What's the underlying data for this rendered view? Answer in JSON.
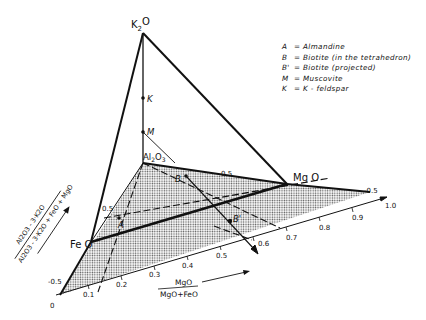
{
  "vertices": {
    "k2o": "K",
    "k2o_sub": "2",
    "k2o_o": "O",
    "al2o3": "Al",
    "al2o3_sub1": "2",
    "al2o3_o": "O",
    "al2o3_sub2": "3",
    "feo": "Fe O",
    "mgo": "Mg O"
  },
  "points": {
    "K": "K",
    "M": "M",
    "A": "A",
    "B": "B",
    "Bp": "B'"
  },
  "legend": [
    {
      "key": "A",
      "text": "Almandine"
    },
    {
      "key": "B",
      "text": "Biotite (in the tetrahedron)"
    },
    {
      "key": "B'",
      "text": "Biotite (projected)"
    },
    {
      "key": "M",
      "text": "Muscovite"
    },
    {
      "key": "K",
      "text": "K - feldspar"
    }
  ],
  "legend_eq": "=",
  "x_axis": {
    "ticks": [
      "0",
      "0.1",
      "0.2",
      "0.3",
      "0.4",
      "0.5",
      "0.6",
      "0.7",
      "0.8",
      "0.9",
      "1.0"
    ],
    "label_num": "MgO",
    "label_den": "MgO+FeO"
  },
  "y_axis": {
    "label_num": "Al2O3 - 3·K2O",
    "label_den": "Al2O3 - 3·K2O + FeO + MgO",
    "ticks": [
      "-0.5",
      "0.5"
    ]
  },
  "plane_ticks": {
    "left_upper": "0.5",
    "left_lower": "-0.5",
    "top": "0.5",
    "right": "-0.5"
  },
  "colors": {
    "line": "#111111",
    "shade": "#b8b8b8",
    "background": "#ffffff"
  }
}
